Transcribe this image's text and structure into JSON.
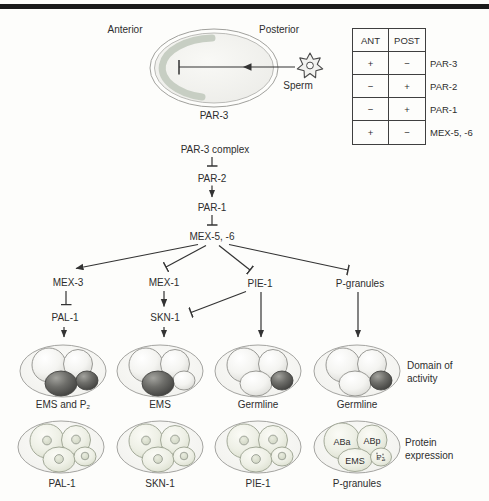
{
  "egg_diagram": {
    "anterior": "Anterior",
    "posterior": "Posterior",
    "sperm": "Sperm",
    "par3": "PAR-3",
    "crescent_color": "#c7cec3"
  },
  "table": {
    "headers": [
      "ANT",
      "POST"
    ],
    "rows": [
      {
        "ant": "+",
        "post": "−",
        "label": "PAR-3"
      },
      {
        "ant": "−",
        "post": "+",
        "label": "PAR-2"
      },
      {
        "ant": "−",
        "post": "+",
        "label": "PAR-1"
      },
      {
        "ant": "+",
        "post": "−",
        "label": "MEX-5, -6"
      }
    ]
  },
  "cascade": {
    "node1": "PAR-3 complex",
    "node2": "PAR-2",
    "node3": "PAR-1",
    "node4": "MEX-5, -6"
  },
  "branches": {
    "mex3": "MEX-3",
    "mex1": "MEX-1",
    "pie1": "PIE-1",
    "pgranules": "P-granules",
    "pal1": "PAL-1",
    "skn1": "SKN-1"
  },
  "domain_row": {
    "caption_line1": "Domain of",
    "caption_line2": "activity",
    "embryos": [
      {
        "label": "EMS and P₂"
      },
      {
        "label": "EMS"
      },
      {
        "label": "Germline"
      },
      {
        "label": "Germline"
      }
    ]
  },
  "expression_row": {
    "caption_line1": "Protein",
    "caption_line2": "expression",
    "embryos": [
      {
        "label": "PAL-1"
      },
      {
        "label": "SKN-1"
      },
      {
        "label": "PIE-1"
      },
      {
        "label": "P-granules"
      }
    ],
    "cell_labels": {
      "aba": "ABa",
      "abp": "ABp",
      "ems": "EMS",
      "p2": "P₂"
    }
  },
  "colors": {
    "dark_cell": "#4a4a47",
    "light_cell": "#f2f2ee",
    "expression_cell": "#e9ebdf",
    "text": "#2e2e2e",
    "top_rule": "#1a1a1a"
  }
}
